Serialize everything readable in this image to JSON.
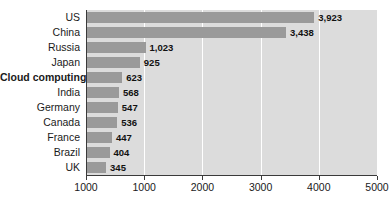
{
  "chart_data": {
    "type": "bar",
    "orientation": "horizontal",
    "title": "",
    "subtitle": "",
    "xlabel": "",
    "ylabel": "",
    "grid": true,
    "legend": null,
    "xlim": [
      0,
      5000
    ],
    "categories": [
      "US",
      "China",
      "Russia",
      "Japan",
      "Cloud computing",
      "India",
      "Germany",
      "Canada",
      "France",
      "Brazil",
      "UK"
    ],
    "values": [
      3923,
      3438,
      1023,
      925,
      623,
      568,
      547,
      536,
      447,
      404,
      345
    ],
    "value_labels": [
      "3,923",
      "3,438",
      "1,023",
      "925",
      "623",
      "568",
      "547",
      "536",
      "447",
      "404",
      "345"
    ],
    "emphasized_categories": [
      "Cloud computing"
    ],
    "xticks": [
      0,
      1000,
      2000,
      3000,
      4000,
      5000
    ],
    "xtick_labels": [
      "1000",
      "1000",
      "2000",
      "3000",
      "4000",
      "5000"
    ],
    "colors": {
      "bar": "#9a9a9a",
      "plot_background": "#dcdcdc",
      "gridline": "#ffffff",
      "axis": "#3a3a3a",
      "text": "#1a1a1a",
      "page_background": "#ffffff"
    }
  }
}
